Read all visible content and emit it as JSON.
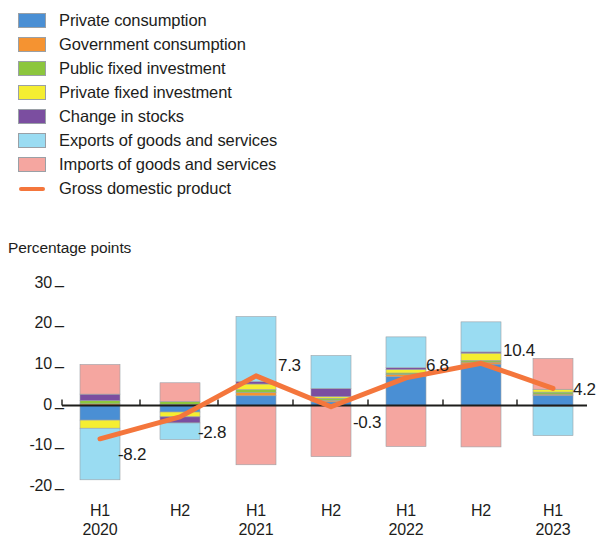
{
  "chart_data": {
    "type": "bar",
    "title": "",
    "ylabel": "Percentage points",
    "xlabel": "",
    "stacked": true,
    "grid": false,
    "legend_position": "top-left",
    "ylim": [
      -20,
      30
    ],
    "yticks": [
      30,
      20,
      10,
      0,
      -10,
      -20
    ],
    "ytick_labels": [
      "30",
      "20",
      "10",
      "0",
      "-10",
      "-20"
    ],
    "categories": [
      "H1",
      "H2",
      "H1",
      "H2",
      "H1",
      "H2",
      "H1"
    ],
    "category_years": [
      "2020",
      "",
      "2021",
      "",
      "2022",
      "",
      "2023"
    ],
    "series": [
      {
        "name": "Private consumption",
        "color": "#4a8fd4",
        "values": [
          -3.6,
          -1.6,
          2.4,
          0.9,
          7.1,
          10.2,
          2.5
        ]
      },
      {
        "name": "Government consumption",
        "color": "#f59331",
        "values": [
          0.4,
          0.3,
          0.8,
          0.4,
          0.5,
          0.5,
          0.3
        ]
      },
      {
        "name": "Public fixed investment",
        "color": "#8cc63e",
        "values": [
          0.8,
          0.7,
          0.7,
          0.5,
          0.4,
          0.4,
          0.5
        ]
      },
      {
        "name": "Private fixed investment",
        "color": "#f5ee31",
        "values": [
          -2.0,
          -1.2,
          1.4,
          0.4,
          0.9,
          1.8,
          0.7
        ]
      },
      {
        "name": "Change in stocks",
        "color": "#7b4ea0",
        "values": [
          1.6,
          -1.5,
          0.6,
          2.0,
          0.4,
          0.3,
          -0.2
        ]
      },
      {
        "name": "Exports of goods and services",
        "color": "#9adcf2",
        "values": [
          -12.7,
          -4.1,
          16.0,
          8.1,
          7.6,
          7.4,
          -7.2
        ]
      },
      {
        "name": "Imports of goods and services",
        "color": "#f5a6a0",
        "values": [
          7.3,
          4.6,
          -14.6,
          -12.6,
          -10.1,
          -10.2,
          7.6
        ]
      }
    ],
    "line_series": {
      "name": "Gross domestic product",
      "color": "#f4763c",
      "values": [
        -8.2,
        -2.8,
        7.3,
        -0.3,
        6.8,
        10.4,
        4.2
      ],
      "labels": [
        "-8.2",
        "-2.8",
        "7.3",
        "-0.3",
        "6.8",
        "10.4",
        "4.2"
      ]
    }
  },
  "legend": {
    "items": [
      {
        "label": "Private consumption",
        "color": "#4a8fd4",
        "marker": "swatch"
      },
      {
        "label": "Government consumption",
        "color": "#f59331",
        "marker": "swatch"
      },
      {
        "label": "Public fixed investment",
        "color": "#8cc63e",
        "marker": "swatch"
      },
      {
        "label": "Private fixed investment",
        "color": "#f5ee31",
        "marker": "swatch"
      },
      {
        "label": "Change in stocks",
        "color": "#7b4ea0",
        "marker": "swatch"
      },
      {
        "label": "Exports of goods and services",
        "color": "#9adcf2",
        "marker": "swatch"
      },
      {
        "label": "Imports of goods and services",
        "color": "#f5a6a0",
        "marker": "swatch"
      },
      {
        "label": "Gross domestic product",
        "color": "#f4763c",
        "marker": "line"
      }
    ]
  },
  "axis": {
    "y_title": "Percentage points",
    "baseline_color": "#1d1d1b"
  }
}
